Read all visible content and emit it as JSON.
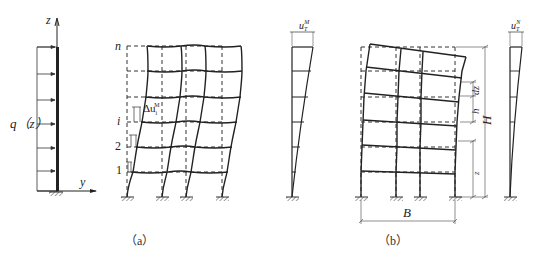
{
  "figure": {
    "panel_a": {
      "caption": "（a）",
      "load_diagram": {
        "load_label": "q（z）",
        "axis_z": "z",
        "axis_y": "y"
      },
      "frame": {
        "floor_labels": [
          "n",
          "i",
          "2",
          "1"
        ],
        "drift_label": "Δu",
        "drift_sup": "M",
        "drift_sub": "i",
        "bays": 3
      },
      "deflection_profile": {
        "label": "u",
        "label_sub": "T",
        "label_sup": "M"
      }
    },
    "panel_b": {
      "caption": "（b）",
      "frame": {
        "dim_total_height": "H",
        "dim_story_height": "h",
        "dim_increment": "dz",
        "dim_z": "z",
        "dim_width": "B"
      },
      "deflection_profile": {
        "label": "u",
        "label_sub": "T",
        "label_sup": "N"
      }
    }
  },
  "colors": {
    "line": "#2a2a2a",
    "dashed": "#333333",
    "background": "#ffffff"
  }
}
